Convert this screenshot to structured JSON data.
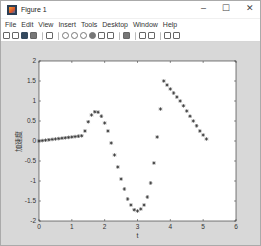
{
  "window": {
    "title": "Figure 1",
    "controls": {
      "minimize": "–",
      "maximize": "☐",
      "close": "✕"
    }
  },
  "menubar": {
    "items": [
      "File",
      "Edit",
      "View",
      "Insert",
      "Tools",
      "Desktop",
      "Window",
      "Help"
    ]
  },
  "toolbar": {
    "icons": [
      "new-figure-icon",
      "open-file-icon",
      "save-icon",
      "print-icon",
      "separator",
      "edit-plot-arrow-icon",
      "separator",
      "zoom-in-icon",
      "zoom-out-icon",
      "pan-icon",
      "rotate-3d-icon",
      "data-cursor-icon",
      "brush-icon",
      "brush-dropdown-icon",
      "separator",
      "link-plot-icon",
      "separator",
      "insert-colorbar-icon",
      "insert-legend-icon",
      "separator",
      "hide-plot-tools-icon",
      "show-plot-tools-icon"
    ]
  },
  "colors": {
    "figure_bg": "#d8d8d8",
    "axes_bg": "#ffffff",
    "marker": "#333333"
  },
  "chart_data": {
    "type": "scatter",
    "title": "",
    "xlabel": "t",
    "ylabel": "加速度",
    "xlim": [
      0,
      6
    ],
    "ylim": [
      -2,
      2
    ],
    "xticks": [
      0,
      1,
      2,
      3,
      4,
      5,
      6
    ],
    "yticks": [
      -2,
      -1.5,
      -1,
      -0.5,
      0,
      0.5,
      1,
      1.5,
      2
    ],
    "ytick_labels": [
      "-2",
      "-1.5",
      "-1",
      "-0.5",
      "0",
      "0.5",
      "1",
      "1.5",
      "2"
    ],
    "grid": false,
    "legend": null,
    "marker": "*",
    "series": [
      {
        "name": "acceleration",
        "x": [
          0.0,
          0.1,
          0.2,
          0.3,
          0.4,
          0.5,
          0.6,
          0.7,
          0.8,
          0.9,
          1.0,
          1.1,
          1.2,
          1.3,
          1.4,
          1.5,
          1.6,
          1.7,
          1.8,
          1.9,
          2.0,
          2.1,
          2.2,
          2.3,
          2.4,
          2.5,
          2.6,
          2.7,
          2.8,
          2.9,
          3.0,
          3.1,
          3.2,
          3.3,
          3.4,
          3.5,
          3.6,
          3.7,
          3.8,
          3.9,
          4.0,
          4.1,
          4.2,
          4.3,
          4.4,
          4.5,
          4.6,
          4.7,
          4.8,
          4.9,
          5.0,
          5.1
        ],
        "y": [
          0.0,
          0.01,
          0.02,
          0.03,
          0.04,
          0.05,
          0.06,
          0.07,
          0.08,
          0.09,
          0.1,
          0.11,
          0.12,
          0.13,
          0.25,
          0.48,
          0.65,
          0.73,
          0.72,
          0.62,
          0.45,
          0.25,
          -0.05,
          -0.35,
          -0.65,
          -0.95,
          -1.2,
          -1.45,
          -1.6,
          -1.72,
          -1.75,
          -1.7,
          -1.6,
          -1.4,
          -1.05,
          -0.55,
          0.1,
          0.8,
          1.5,
          1.4,
          1.3,
          1.2,
          1.1,
          1.0,
          0.88,
          0.75,
          0.62,
          0.5,
          0.38,
          0.25,
          0.15,
          0.05
        ]
      }
    ]
  }
}
